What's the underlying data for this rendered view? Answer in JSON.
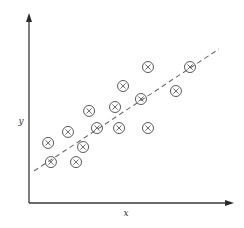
{
  "chart_data": {
    "type": "scatter",
    "title": "",
    "xlabel": "x",
    "ylabel": "y",
    "xlim": [
      0,
      10
    ],
    "ylim": [
      0,
      10
    ],
    "grid": false,
    "legend": null,
    "ticks": "none",
    "marker": "circled-x",
    "colors": {
      "axis": "#3a3a3a",
      "marker": "#5a5a5a",
      "trend": "#6e6e6e"
    },
    "points": [
      {
        "x": 0.95,
        "y": 3.23
      },
      {
        "x": 1.09,
        "y": 2.2
      },
      {
        "x": 1.94,
        "y": 3.82
      },
      {
        "x": 2.34,
        "y": 2.2
      },
      {
        "x": 2.69,
        "y": 3.01
      },
      {
        "x": 2.99,
        "y": 4.95
      },
      {
        "x": 3.38,
        "y": 4.03
      },
      {
        "x": 4.28,
        "y": 5.16
      },
      {
        "x": 4.48,
        "y": 4.03
      },
      {
        "x": 4.68,
        "y": 6.29
      },
      {
        "x": 5.57,
        "y": 5.59
      },
      {
        "x": 5.92,
        "y": 7.31
      },
      {
        "x": 5.92,
        "y": 4.03
      },
      {
        "x": 7.31,
        "y": 6.02
      },
      {
        "x": 8.01,
        "y": 7.31
      }
    ],
    "trend_line": {
      "style": "dashed",
      "start": {
        "x": 0.25,
        "y": 1.72
      },
      "end": {
        "x": 9.45,
        "y": 8.28
      }
    }
  }
}
